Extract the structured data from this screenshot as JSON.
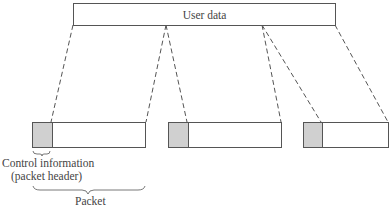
{
  "diagram": {
    "user_data_label": "User data",
    "packets": [
      {
        "id": 1,
        "has_header": true
      },
      {
        "id": 2,
        "has_header": true
      },
      {
        "id": 3,
        "has_header": true
      }
    ],
    "header_annotation": {
      "line1": "Control information",
      "line2": "(packet header)"
    },
    "packet_annotation": "Packet",
    "colors": {
      "header_fill": "#d0d0d0",
      "stroke": "#555555",
      "background": "#ffffff"
    }
  }
}
